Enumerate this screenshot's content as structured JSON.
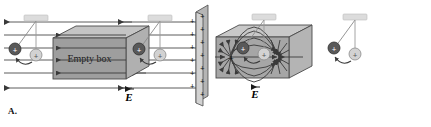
{
  "figure": {
    "background_color": "#ffffff",
    "width": 431,
    "height": 127
  },
  "panels": [
    {
      "id": "A",
      "label": "A.",
      "box_label": "Empty box",
      "field_label": "E",
      "field_label_accent": "→",
      "description": "uniform field through empty box",
      "field_line_count": 6,
      "field_direction": "left",
      "plate": {
        "present": true,
        "charge_symbol": "+",
        "front_count": 6,
        "side_count": 6,
        "face_color": "#c9c9c9",
        "side_color": "#9a9a9a"
      },
      "box": {
        "front_color": "#9e9e9e",
        "top_color": "#c4c4c4",
        "side_color": "#b0b0b0",
        "edge_color": "#4a4a4a"
      },
      "pendulums": [
        {
          "position": "left",
          "support_color": "#d9d9d9",
          "deflected_sphere_symbol": "+",
          "deflected_sphere_color": "#595959",
          "rest_sphere_symbol": "+",
          "rest_sphere_color": "#cfcfcf",
          "deflection_side": "left"
        },
        {
          "position": "right",
          "support_color": "#d9d9d9",
          "deflected_sphere_symbol": "+",
          "deflected_sphere_color": "#595959",
          "rest_sphere_symbol": "+",
          "rest_sphere_color": "#cfcfcf",
          "deflection_side": "left"
        }
      ]
    },
    {
      "id": "B",
      "label": "B.",
      "box_label": "",
      "field_label": "E",
      "field_label_accent": "→",
      "description": "dipole field inside box",
      "source_symbol": "+",
      "sink_symbol": "",
      "curved_line_count": 10,
      "box": {
        "front_color": "#a6a6a6",
        "top_color": "#c8c8c8",
        "side_color": "#b4b4b4",
        "edge_color": "#4a4a4a"
      },
      "pendulums": [
        {
          "position": "left",
          "support_color": "#d9d9d9",
          "deflected_sphere_symbol": "+",
          "deflected_sphere_color": "#595959",
          "rest_sphere_symbol": "+",
          "rest_sphere_color": "#cfcfcf",
          "deflection_side": "left"
        },
        {
          "position": "right",
          "support_color": "#d9d9d9",
          "deflected_sphere_symbol": "+",
          "deflected_sphere_color": "#595959",
          "rest_sphere_symbol": "+",
          "rest_sphere_color": "#cfcfcf",
          "deflection_side": "left"
        }
      ]
    }
  ]
}
